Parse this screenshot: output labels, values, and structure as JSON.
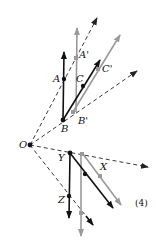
{
  "figure": {
    "number_label": "(4)",
    "colors": {
      "black": "#111111",
      "gray": "#9a9a9a",
      "dash": "#222222"
    },
    "origin": {
      "label": "O",
      "x": 30,
      "y": 145
    },
    "points": {
      "A": {
        "label": "A",
        "x": 64,
        "y": 79
      },
      "A_prime": {
        "label": "A'",
        "x": 76,
        "y": 58
      },
      "B": {
        "label": "B",
        "x": 63,
        "y": 120
      },
      "B_prime": {
        "label": "B'",
        "x": 73,
        "y": 112
      },
      "C": {
        "label": "C",
        "x": 83,
        "y": 86
      },
      "C_prime": {
        "label": "C'",
        "x": 98,
        "y": 69
      },
      "X": {
        "label": "X",
        "x": 100,
        "y": 176
      },
      "Y": {
        "label": "Y",
        "x": 70,
        "y": 153
      },
      "Z": {
        "label": "Z",
        "x": 69,
        "y": 196
      }
    }
  }
}
